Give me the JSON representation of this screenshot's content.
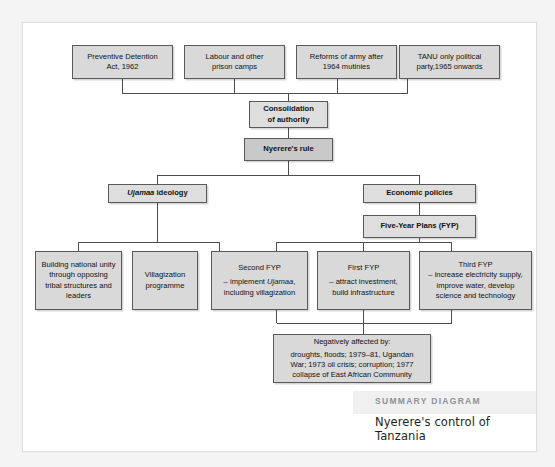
{
  "diagram": {
    "type": "flowchart",
    "nodes": [
      {
        "id": "preventive-detention",
        "lines": [
          "Preventive Detention",
          "Act, 1962"
        ],
        "row": "top"
      },
      {
        "id": "labour-camps",
        "lines": [
          "Labour and other",
          "prison camps"
        ],
        "row": "top"
      },
      {
        "id": "army-reforms",
        "lines": [
          "Reforms of army after",
          "1964 mutinies"
        ],
        "row": "top"
      },
      {
        "id": "tanu-party",
        "lines": [
          "TANU only political",
          "party,1965 onwards"
        ],
        "row": "top"
      },
      {
        "id": "consolidation",
        "lines": [
          "Consolidation",
          "of authority"
        ],
        "row": "second"
      },
      {
        "id": "nyereres-rule",
        "lines": [
          "Nyerere's rule"
        ],
        "row": "third"
      },
      {
        "id": "ujamaa-ideology",
        "lines": [
          "Ujamaa ideology"
        ],
        "row": "fourth"
      },
      {
        "id": "economic-policies",
        "lines": [
          "Economic policies"
        ],
        "row": "fourth"
      },
      {
        "id": "five-year-plans",
        "lines": [
          "Five-Year Plans (FYP)"
        ],
        "row": "fifth"
      },
      {
        "id": "national-unity",
        "lines": [
          "Building national unity",
          "through opposing",
          "tribal structures and",
          "leaders"
        ],
        "row": "bottom"
      },
      {
        "id": "villagization",
        "lines": [
          "Villagization",
          "programme"
        ],
        "row": "bottom"
      },
      {
        "id": "second-fyp",
        "title": "Second FYP",
        "lines": [
          "– implement Ujamaa,",
          "including villagization"
        ],
        "row": "bottom"
      },
      {
        "id": "first-fyp",
        "title": "First FYP",
        "lines": [
          "– attract investment,",
          "build infrastructure"
        ],
        "row": "bottom"
      },
      {
        "id": "third-fyp",
        "title": "Third FYP",
        "lines": [
          "– increase electricity supply,",
          "improve water, develop",
          "science and technology"
        ],
        "row": "bottom"
      },
      {
        "id": "negatively-affected",
        "title": "Negatively affected by:",
        "lines": [
          "droughts, floods; 1979–81, Ugandan",
          "War; 1973 oil crisis; corruption; 1977",
          "collapse of East African Community"
        ],
        "row": "footer"
      }
    ]
  },
  "nodes": {
    "preventive_detention": {
      "l1": "Preventive Detention",
      "l2": "Act, 1962"
    },
    "labour_camps": {
      "l1": "Labour and other",
      "l2": "prison camps"
    },
    "army_reforms": {
      "l1": "Reforms of army after",
      "l2": "1964 mutinies"
    },
    "tanu_party": {
      "l1": "TANU only political",
      "l2": "party,1965 onwards"
    },
    "consolidation": {
      "l1": "Consolidation",
      "l2": "of authority"
    },
    "nyereres_rule": {
      "l1": "Nyerere's rule"
    },
    "ujamaa_ideology": {
      "em": "Ujamaa",
      "rest": " ideology"
    },
    "economic_policies": {
      "l1": "Economic policies"
    },
    "five_year_plans": {
      "l1": "Five-Year Plans (FYP)"
    },
    "national_unity": {
      "l1": "Building national unity",
      "l2": "through opposing",
      "l3": "tribal structures and",
      "l4": "leaders"
    },
    "villagization": {
      "l1": "Villagization",
      "l2": "programme"
    },
    "second_fyp": {
      "title": "Second FYP",
      "pre": "– implement ",
      "em": "Ujamaa",
      "post": ",",
      "l2": "including villagization"
    },
    "first_fyp": {
      "title": "First FYP",
      "l1": "– attract investment,",
      "l2": "build infrastructure"
    },
    "third_fyp": {
      "title": "Third FYP",
      "l1": "– increase electricity supply,",
      "l2": "improve water, develop",
      "l3": "science and technology"
    },
    "negatively_affected": {
      "title": "Negatively affected by:",
      "l1": "droughts, floods; 1979–81, Ugandan",
      "l2": "War; 1973 oil crisis; corruption; 1977",
      "l3": "collapse of East African Community"
    }
  },
  "summary": {
    "label": "SUMMARY DIAGRAM",
    "title": "Nyerere's control of Tanzania"
  },
  "colors": {
    "box_fill": "#d9d9d9",
    "box_fill_light": "#dedede",
    "box_fill_mid": "#c9c9c9",
    "box_border": "#595959",
    "page_bg": "#f4f4f4",
    "sheet_bg": "#ffffff",
    "summary_label": "#8e9196",
    "summary_band": "#f0f0f0"
  }
}
